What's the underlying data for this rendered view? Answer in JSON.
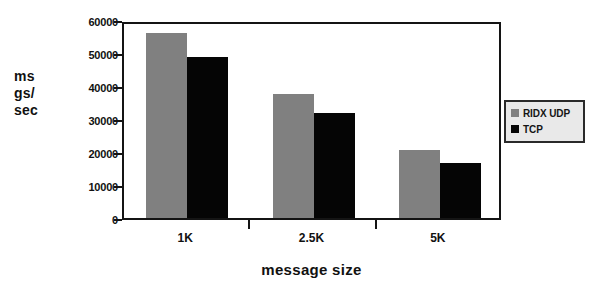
{
  "chart_data": {
    "type": "bar",
    "title": "",
    "subtitle": "",
    "xlabel": "message size",
    "ylabel": "msgs/sec",
    "ylabel_lines": [
      "ms",
      "gs/",
      "sec"
    ],
    "categories": [
      "1K",
      "2.5K",
      "5K"
    ],
    "series": [
      {
        "name": "RIDX UDP",
        "color": "#808080",
        "values": [
          56000,
          37700,
          20700
        ]
      },
      {
        "name": "TCP",
        "color": "#050505",
        "values": [
          48700,
          31700,
          16800
        ]
      }
    ],
    "ylim": [
      0,
      60000
    ],
    "yticks": [
      0,
      10000,
      20000,
      30000,
      40000,
      50000,
      60000
    ],
    "ytick_labels": [
      "0",
      "10000",
      "20000",
      "30000",
      "40000",
      "50000",
      "60000"
    ],
    "grid": false,
    "legend_position": "right",
    "axis_color": "#141414",
    "background": "#ffffff"
  },
  "legend": {
    "entries": [
      {
        "label": "RIDX UDP",
        "color": "#808080"
      },
      {
        "label": "TCP",
        "color": "#050505"
      }
    ]
  }
}
